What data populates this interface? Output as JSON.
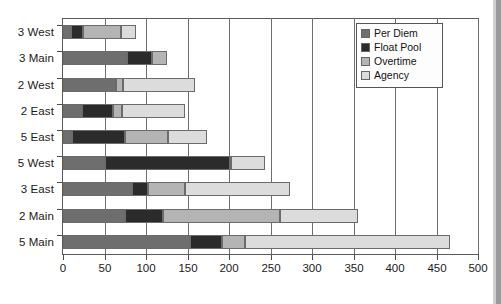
{
  "chart_data": {
    "type": "bar",
    "orientation": "horizontal",
    "stacked": true,
    "title": "",
    "subtitle": "",
    "xlabel": "",
    "ylabel": "",
    "xlim": [
      0,
      500
    ],
    "xticks": [
      0,
      50,
      100,
      150,
      200,
      250,
      300,
      350,
      400,
      450,
      500
    ],
    "xtick_labels": [
      "0",
      "50",
      "100",
      "150",
      "200",
      "250",
      "300",
      "350",
      "400",
      "450",
      "500"
    ],
    "grid": true,
    "grid_axis": "x",
    "legend_position": "top-right",
    "categories": [
      "3 West",
      "3 Main",
      "2 West",
      "2 East",
      "5 East",
      "5 West",
      "3 East",
      "2 Main",
      "5 Main"
    ],
    "series": [
      {
        "name": "Per Diem",
        "color": "#6e6e6e",
        "values": [
          10,
          77,
          64,
          23,
          11,
          50,
          83,
          75,
          153
        ]
      },
      {
        "name": "Float Pool",
        "color": "#2b2b2b",
        "values": [
          14,
          30,
          0,
          37,
          64,
          151,
          19,
          45,
          38
        ]
      },
      {
        "name": "Overtime",
        "color": "#b4b4b4",
        "values": [
          46,
          18,
          8,
          11,
          51,
          2,
          45,
          141,
          28
        ]
      },
      {
        "name": "Agency",
        "color": "#dcdcdc",
        "values": [
          18,
          0,
          87,
          76,
          48,
          40,
          126,
          94,
          247
        ]
      }
    ],
    "totals": [
      88,
      125,
      159,
      147,
      174,
      243,
      273,
      355,
      466
    ]
  },
  "legend": {
    "items": [
      {
        "label": "Per Diem"
      },
      {
        "label": "Float Pool"
      },
      {
        "label": "Overtime"
      },
      {
        "label": "Agency"
      }
    ]
  }
}
